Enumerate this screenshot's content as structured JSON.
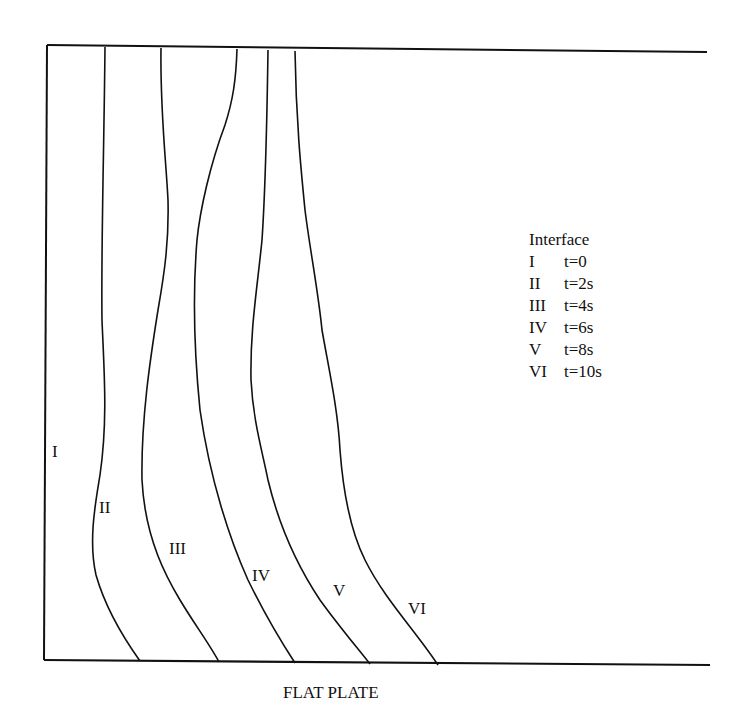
{
  "figure": {
    "caption": "FLAT PLATE",
    "legend": {
      "title": "Interface",
      "entries": [
        {
          "id": "I",
          "time": "t=0"
        },
        {
          "id": "II",
          "time": "t=2s"
        },
        {
          "id": "III",
          "time": "t=4s"
        },
        {
          "id": "IV",
          "time": "t=6s"
        },
        {
          "id": "V",
          "time": "t=8s"
        },
        {
          "id": "VI",
          "time": "t=10s"
        }
      ]
    },
    "curve_labels": [
      "I",
      "II",
      "III",
      "IV",
      "V",
      "VI"
    ],
    "stroke_color": "#111111",
    "background": "#ffffff"
  }
}
